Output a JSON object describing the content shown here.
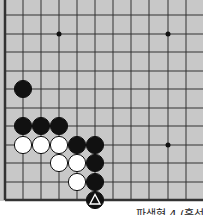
{
  "diagram": {
    "type": "go-board-fragment",
    "board_color": "#c8c8c8",
    "line_color": "#333333",
    "grid": {
      "x_lines": [
        5,
        23,
        41,
        59,
        77,
        95,
        113,
        131,
        149,
        168,
        186
      ],
      "y_lines": [
        15,
        34,
        52,
        71,
        89,
        108,
        126,
        145,
        163,
        182,
        200
      ],
      "left_edge": true,
      "bottom_edge": true
    },
    "star_points": [
      [
        3,
        1
      ],
      [
        9,
        1
      ],
      [
        9,
        7
      ]
    ],
    "stones": [
      {
        "color": "black",
        "col": 1,
        "row": 4
      },
      {
        "color": "black",
        "col": 1,
        "row": 6
      },
      {
        "color": "black",
        "col": 2,
        "row": 6
      },
      {
        "color": "black",
        "col": 3,
        "row": 6
      },
      {
        "color": "white",
        "col": 1,
        "row": 7
      },
      {
        "color": "white",
        "col": 2,
        "row": 7
      },
      {
        "color": "white",
        "col": 3,
        "row": 7
      },
      {
        "color": "black",
        "col": 4,
        "row": 7
      },
      {
        "color": "black",
        "col": 5,
        "row": 7
      },
      {
        "color": "white",
        "col": 3,
        "row": 8
      },
      {
        "color": "white",
        "col": 4,
        "row": 8
      },
      {
        "color": "black",
        "col": 5,
        "row": 8
      },
      {
        "color": "white",
        "col": 4,
        "row": 9
      },
      {
        "color": "black",
        "col": 5,
        "row": 9
      },
      {
        "color": "black",
        "col": 5,
        "row": 10,
        "marker": "triangle"
      }
    ],
    "caption": "파생형 4 (흑선)"
  }
}
